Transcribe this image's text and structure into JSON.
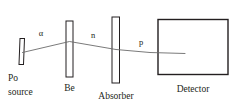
{
  "diagram": {
    "background_color": "#ffffff",
    "line_color": "#231f20",
    "beam_color": "#6b6b6b",
    "components": [
      {
        "id": "po-source",
        "label_line1": "Po",
        "label_line2": "source",
        "shape": "thin-bar"
      },
      {
        "id": "be-target",
        "label": "Be",
        "shape": "tall-bar"
      },
      {
        "id": "absorber",
        "label": "Absorber",
        "shape": "tall-bar"
      },
      {
        "id": "detector",
        "label": "Detector",
        "shape": "box"
      }
    ],
    "particles": [
      {
        "id": "alpha",
        "symbol": "α",
        "segment": "source-to-be"
      },
      {
        "id": "neutron",
        "symbol": "n",
        "segment": "be-to-absorber"
      },
      {
        "id": "proton",
        "symbol": "p",
        "segment": "absorber-to-detector"
      }
    ]
  }
}
